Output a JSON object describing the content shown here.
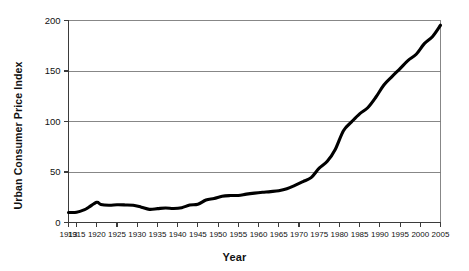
{
  "chart_data": {
    "type": "line",
    "title": "",
    "xlabel": "Year",
    "ylabel": "Urban Consumer Price Index",
    "xlim": [
      1913,
      2005
    ],
    "ylim": [
      0,
      200
    ],
    "grid": true,
    "legend": false,
    "legend_position": "none",
    "line_color": "#000000",
    "gridline_color": "#7a7a7a",
    "axis_color": "#3b3b3b",
    "background_color": "#ffffff",
    "ytick_labels": [
      "0",
      "50",
      "100",
      "150",
      "200"
    ],
    "ytick_values": [
      0,
      50,
      100,
      150,
      200
    ],
    "xtick_labels": [
      "1913",
      "1915",
      "1920",
      "1925",
      "1930",
      "1935",
      "1940",
      "1945",
      "1950",
      "1955",
      "1960",
      "1965",
      "1970",
      "1975",
      "1980",
      "1985",
      "1990",
      "1995",
      "2000",
      "2005"
    ],
    "xtick_values": [
      1913,
      1915,
      1920,
      1925,
      1930,
      1935,
      1940,
      1945,
      1950,
      1955,
      1960,
      1965,
      1970,
      1975,
      1980,
      1985,
      1990,
      1995,
      2000,
      2005
    ],
    "series": [
      {
        "name": "Urban Consumer Price Index",
        "x": [
          1913,
          1915,
          1917,
          1918,
          1920,
          1921,
          1923,
          1925,
          1927,
          1929,
          1931,
          1933,
          1935,
          1937,
          1939,
          1941,
          1943,
          1945,
          1947,
          1949,
          1951,
          1953,
          1955,
          1957,
          1959,
          1961,
          1963,
          1965,
          1967,
          1969,
          1971,
          1973,
          1975,
          1977,
          1979,
          1981,
          1983,
          1985,
          1987,
          1989,
          1991,
          1993,
          1995,
          1997,
          1999,
          2001,
          2003,
          2005
        ],
        "values": [
          9.9,
          10.1,
          12.8,
          15.1,
          20.0,
          17.9,
          17.1,
          17.5,
          17.4,
          17.1,
          15.2,
          13.0,
          13.7,
          14.4,
          13.9,
          14.7,
          17.3,
          18.0,
          22.3,
          23.8,
          26.0,
          26.7,
          26.8,
          28.1,
          29.1,
          29.9,
          30.6,
          31.5,
          33.4,
          36.7,
          40.5,
          44.4,
          53.8,
          60.6,
          72.6,
          90.9,
          99.6,
          107.6,
          113.6,
          124.0,
          136.2,
          144.5,
          152.4,
          160.5,
          166.6,
          177.1,
          184.0,
          195.3
        ]
      }
    ],
    "annotations": []
  },
  "axes": {
    "y_title": "Urban Consumer Price Index",
    "x_title": "Year"
  }
}
